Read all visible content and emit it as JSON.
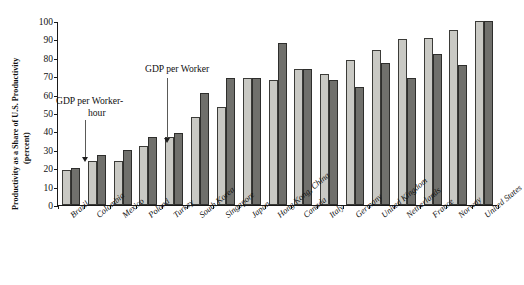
{
  "chart_data": {
    "type": "bar",
    "title": "",
    "xlabel": "",
    "ylabel_line1": "Productivity as a Share of U.S. Productivity",
    "ylabel_line2": "(percent)",
    "ylim": [
      0,
      100
    ],
    "yticks": [
      0,
      10,
      20,
      30,
      40,
      50,
      60,
      70,
      80,
      90,
      100
    ],
    "grid": false,
    "legend_position": "none",
    "categories": [
      "Brazil",
      "Colombia",
      "Mexico",
      "Poland",
      "Turkey",
      "South Korea",
      "Singapore",
      "Japan",
      "Hong Kong, China",
      "Canada",
      "Italy",
      "Germany",
      "United Kingdom",
      "Netherlands",
      "France",
      "Norway",
      "United States"
    ],
    "series": [
      {
        "name": "GDP per Worker-hour",
        "color": "#c9c9c4",
        "values": [
          19,
          24,
          24,
          32,
          37,
          48,
          53,
          69,
          68,
          74,
          71,
          79,
          84,
          90,
          91,
          95,
          100
        ]
      },
      {
        "name": "GDP per Worker",
        "color": "#70706c",
        "values": [
          20,
          27,
          30,
          37,
          39,
          61,
          69,
          69,
          88,
          74,
          68,
          64,
          77,
          69,
          82,
          76,
          100
        ]
      }
    ],
    "annotations": [
      {
        "text_line1": "GDP per Worker-",
        "text_line2": "hour",
        "points_to_category": "Colombia",
        "points_to_series": "GDP per Worker-hour"
      },
      {
        "text_line1": "GDP per Worker",
        "text_line2": "",
        "points_to_category": "Poland",
        "points_to_series": "GDP per Worker"
      }
    ]
  },
  "annotations_text": {
    "worker_hour_line1": "GDP per Worker-",
    "worker_hour_line2": "hour",
    "worker_line1": "GDP per Worker"
  },
  "caption": {
    "partial": ""
  }
}
